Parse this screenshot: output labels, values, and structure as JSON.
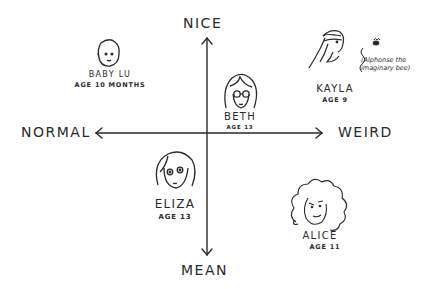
{
  "axes": {
    "top": "NICE",
    "bottom": "MEAN",
    "left": "NORMAL",
    "right": "WEIRD"
  },
  "characters": [
    {
      "name": "BABY LU",
      "age": "AGE 10 MONTHS",
      "quadrant": "nice-normal"
    },
    {
      "name": "BETH",
      "age": "AGE 13",
      "quadrant": "nice-weird"
    },
    {
      "name": "KAYLA",
      "age": "AGE 9",
      "quadrant": "nice-weird",
      "note": "(Alphonse the imaginary bee)"
    },
    {
      "name": "ELIZA",
      "age": "AGE 13",
      "quadrant": "mean-normal"
    },
    {
      "name": "ALICE",
      "age": "AGE 11",
      "quadrant": "mean-weird"
    }
  ],
  "colors": {
    "ink": "#2a2a2a",
    "paper": "#ffffff"
  }
}
